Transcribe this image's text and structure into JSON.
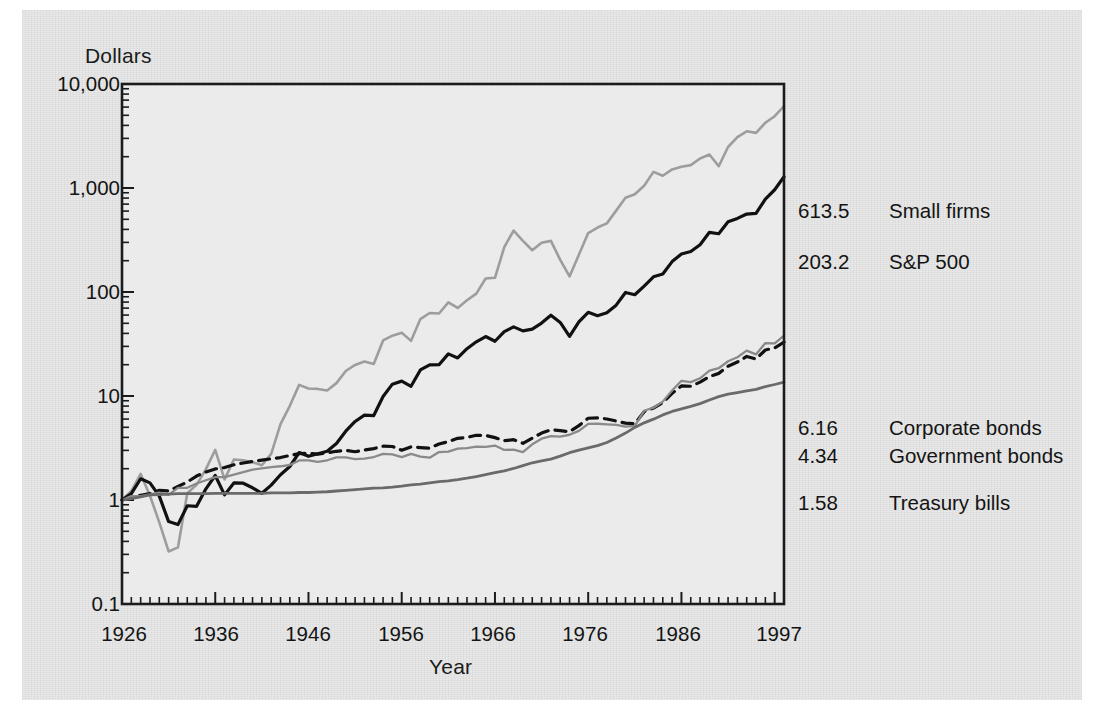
{
  "chart_data": {
    "type": "line",
    "title": "",
    "xlabel": "Year",
    "ylabel": "Dollars",
    "yscale": "log",
    "ylim": [
      0.1,
      10000
    ],
    "xlim": [
      1926,
      1997
    ],
    "grid": false,
    "legend_position": "right-inline-end-labels",
    "y_tick_labels": [
      "10,000",
      "1,000",
      "100",
      "10",
      "1",
      "0.1"
    ],
    "y_tick_values": [
      10000,
      1000,
      100,
      10,
      1,
      0.1
    ],
    "x_tick_labels": [
      "1926",
      "1936",
      "1946",
      "1956",
      "1966",
      "1976",
      "1986",
      "1997"
    ],
    "x_tick_values": [
      1926,
      1936,
      1946,
      1956,
      1966,
      1976,
      1986,
      1997
    ],
    "end_labels": [
      {
        "value": "613.5",
        "name": "Small firms",
        "series": "small_firms",
        "color": "#9d9d9d"
      },
      {
        "value": "203.2",
        "name": "S&P 500",
        "series": "sp500",
        "color": "#111111"
      },
      {
        "value": "6.16",
        "name": "Corporate bonds",
        "series": "corporate_bonds",
        "color": "#111111"
      },
      {
        "value": "4.34",
        "name": "Government bonds",
        "series": "government_bonds",
        "color": "#8a8a8a"
      },
      {
        "value": "1.58",
        "name": "Treasury bills",
        "series": "treasury_bills",
        "color": "#6a6a6a"
      }
    ],
    "x": [
      1926,
      1927,
      1928,
      1929,
      1930,
      1931,
      1932,
      1933,
      1934,
      1935,
      1936,
      1937,
      1938,
      1939,
      1940,
      1941,
      1942,
      1943,
      1944,
      1945,
      1946,
      1947,
      1948,
      1949,
      1950,
      1951,
      1952,
      1953,
      1954,
      1955,
      1956,
      1957,
      1958,
      1959,
      1960,
      1961,
      1962,
      1963,
      1964,
      1965,
      1966,
      1967,
      1968,
      1969,
      1970,
      1971,
      1972,
      1973,
      1974,
      1975,
      1976,
      1977,
      1978,
      1979,
      1980,
      1981,
      1982,
      1983,
      1984,
      1985,
      1986,
      1987,
      1988,
      1989,
      1990,
      1991,
      1992,
      1993,
      1994,
      1995,
      1996,
      1997
    ],
    "series": [
      {
        "name": "Small firms",
        "style": "solid",
        "color": "#9d9d9d",
        "width": 2.6,
        "end_value": 613.5,
        "values": [
          1.0,
          1.22,
          1.78,
          1.1,
          0.61,
          0.32,
          0.35,
          1.16,
          1.4,
          1.98,
          3.03,
          1.58,
          2.45,
          2.41,
          2.31,
          2.16,
          2.78,
          5.36,
          8.05,
          12.8,
          11.8,
          11.7,
          11.3,
          13.3,
          17.4,
          19.9,
          21.5,
          20.3,
          34.2,
          38.0,
          40.5,
          33.9,
          54.9,
          62.8,
          62.1,
          79.5,
          70.3,
          83.2,
          96.5,
          135,
          137,
          270,
          390,
          310,
          252,
          298,
          310,
          204,
          141,
          228,
          369,
          417,
          457,
          606,
          807,
          870,
          1050,
          1430,
          1310,
          1510,
          1600,
          1660,
          1920,
          2100,
          1620,
          2480,
          3080,
          3510,
          3390,
          4240,
          4900,
          6135
        ]
      },
      {
        "name": "S&P 500",
        "style": "solid",
        "color": "#111111",
        "width": 3.2,
        "end_value": 203.2,
        "values": [
          1.0,
          1.15,
          1.6,
          1.46,
          1.09,
          0.62,
          0.58,
          0.88,
          0.87,
          1.28,
          1.72,
          1.12,
          1.46,
          1.45,
          1.31,
          1.16,
          1.39,
          1.75,
          2.1,
          2.86,
          2.63,
          2.78,
          2.94,
          3.49,
          4.59,
          5.69,
          6.54,
          6.49,
          9.9,
          13.0,
          13.9,
          12.4,
          17.8,
          19.9,
          20.0,
          25.4,
          23.2,
          28.5,
          33.2,
          37.3,
          33.6,
          41.6,
          46.2,
          42.3,
          44.0,
          50.3,
          59.8,
          51.0,
          37.5,
          51.5,
          63.8,
          59.2,
          63.1,
          74.7,
          99.0,
          94.1,
          114,
          140,
          149,
          196,
          232,
          245,
          285,
          375,
          363,
          474,
          510,
          562,
          569,
          783,
          962,
          1283
        ]
      },
      {
        "name": "Corporate bonds",
        "style": "dashed",
        "color": "#111111",
        "width": 3.2,
        "end_value": 6.16,
        "values": [
          1.0,
          1.07,
          1.11,
          1.15,
          1.24,
          1.22,
          1.35,
          1.49,
          1.7,
          1.86,
          1.99,
          2.05,
          2.18,
          2.27,
          2.35,
          2.42,
          2.49,
          2.56,
          2.68,
          2.79,
          2.81,
          2.76,
          2.85,
          2.94,
          3.0,
          2.91,
          3.02,
          3.12,
          3.29,
          3.27,
          3.01,
          3.24,
          3.19,
          3.15,
          3.46,
          3.64,
          3.92,
          4.0,
          4.19,
          4.18,
          3.98,
          3.72,
          3.8,
          3.51,
          3.94,
          4.4,
          4.72,
          4.65,
          4.53,
          5.19,
          6.11,
          6.15,
          6.01,
          5.75,
          5.48,
          5.4,
          7.07,
          7.65,
          8.62,
          10.6,
          12.5,
          12.4,
          13.6,
          15.4,
          16.5,
          19.3,
          21.2,
          24.0,
          22.7,
          27.7,
          29.0,
          33.0
        ]
      },
      {
        "name": "Government bonds",
        "style": "solid",
        "color": "#8a8a8a",
        "width": 2.3,
        "end_value": 4.34,
        "values": [
          1.0,
          1.09,
          1.09,
          1.13,
          1.18,
          1.12,
          1.31,
          1.31,
          1.44,
          1.55,
          1.66,
          1.66,
          1.75,
          1.85,
          1.96,
          2.01,
          2.07,
          2.11,
          2.17,
          2.4,
          2.4,
          2.33,
          2.41,
          2.57,
          2.57,
          2.47,
          2.5,
          2.59,
          2.78,
          2.74,
          2.58,
          2.78,
          2.61,
          2.55,
          2.89,
          2.92,
          3.12,
          3.15,
          3.26,
          3.24,
          3.34,
          3.03,
          3.05,
          2.89,
          3.43,
          3.89,
          4.11,
          4.06,
          4.24,
          4.62,
          5.4,
          5.41,
          5.34,
          5.27,
          5.07,
          5.17,
          7.21,
          7.72,
          8.83,
          11.3,
          14.0,
          13.6,
          14.8,
          17.5,
          18.5,
          21.6,
          23.6,
          27.3,
          25.1,
          32.3,
          32.1,
          38.0
        ]
      },
      {
        "name": "Treasury bills",
        "style": "solid",
        "color": "#6a6a6a",
        "width": 2.8,
        "end_value": 1.58,
        "values": [
          1.0,
          1.03,
          1.07,
          1.12,
          1.13,
          1.14,
          1.15,
          1.15,
          1.15,
          1.15,
          1.16,
          1.16,
          1.16,
          1.16,
          1.16,
          1.16,
          1.17,
          1.17,
          1.17,
          1.18,
          1.18,
          1.19,
          1.2,
          1.22,
          1.24,
          1.26,
          1.28,
          1.3,
          1.31,
          1.33,
          1.36,
          1.4,
          1.42,
          1.46,
          1.5,
          1.53,
          1.57,
          1.62,
          1.68,
          1.75,
          1.83,
          1.91,
          2.01,
          2.14,
          2.28,
          2.38,
          2.47,
          2.64,
          2.85,
          3.02,
          3.17,
          3.33,
          3.57,
          3.95,
          4.4,
          4.99,
          5.52,
          5.99,
          6.58,
          7.1,
          7.53,
          7.94,
          8.44,
          9.15,
          9.86,
          10.4,
          10.8,
          11.2,
          11.6,
          12.3,
          12.9,
          13.6
        ]
      }
    ]
  },
  "plot": {
    "frame_color": "#1b1b1b",
    "plot_background": "#ebebeb",
    "page_background": "#e2e2e2"
  }
}
